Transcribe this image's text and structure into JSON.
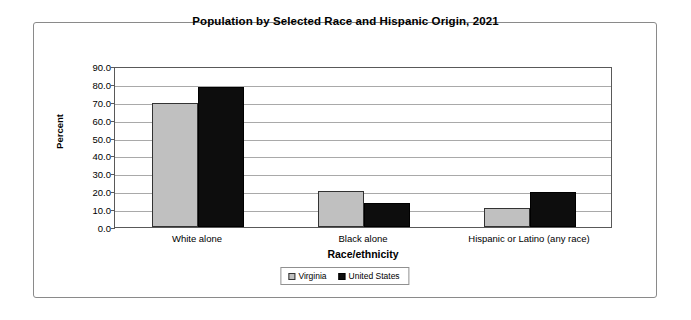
{
  "chart_data": {
    "type": "bar",
    "title": "Population by Selected Race and Hispanic Origin, 2021",
    "xlabel": "Race/ethnicity",
    "ylabel": "Percent",
    "categories": [
      "White alone",
      "Black alone",
      "Hispanic or Latino (any race)"
    ],
    "series": [
      {
        "name": "Virginia",
        "color": "#c0c0c0",
        "values": [
          69.5,
          19.9,
          10.5
        ]
      },
      {
        "name": "United States",
        "color": "#0d0d0d",
        "values": [
          78.5,
          13.6,
          19.5
        ]
      }
    ],
    "ylim": [
      0.0,
      90.0
    ],
    "ytick_step": 10.0,
    "ytick_labels": [
      "90.0",
      "80.0",
      "70.0",
      "60.0",
      "50.0",
      "40.0",
      "30.0",
      "20.0",
      "10.0",
      "0.0"
    ],
    "ytick_values": [
      90.0,
      80.0,
      70.0,
      60.0,
      50.0,
      40.0,
      30.0,
      20.0,
      10.0,
      0.0
    ],
    "grid": true,
    "legend_position": "bottom-center"
  }
}
